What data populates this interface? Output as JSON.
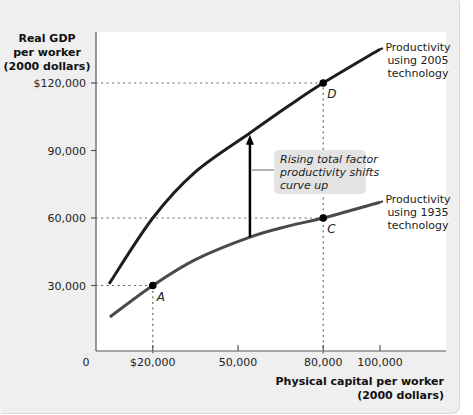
{
  "chart_data": {
    "type": "line",
    "title": "",
    "ylabel_lines": [
      "Real GDP",
      "per worker",
      "(2000 dollars)"
    ],
    "xlabel_lines": [
      "Physical capital per worker",
      "(2000 dollars)"
    ],
    "xlim": [
      0,
      122000
    ],
    "ylim": [
      0,
      142000
    ],
    "grid": false,
    "origin_label": "0",
    "x_ticks": [
      {
        "value": 20000,
        "label": "$20,000"
      },
      {
        "value": 50000,
        "label": "50,000"
      },
      {
        "value": 80000,
        "label": "80,000"
      },
      {
        "value": 100000,
        "label": "100,000"
      }
    ],
    "y_ticks": [
      {
        "value": 30000,
        "label": "30,000"
      },
      {
        "value": 60000,
        "label": "60,000"
      },
      {
        "value": 90000,
        "label": "90,000"
      },
      {
        "value": 120000,
        "label": "$120,000"
      }
    ],
    "series": [
      {
        "name": "Productivity using 2005 technology",
        "label_lines": [
          "Productivity",
          "using 2005",
          "technology"
        ],
        "color": "#1e1e1e",
        "x": [
          4600,
          20000,
          35000,
          54200,
          68000,
          80000,
          100000
        ],
        "y": [
          30700,
          60000,
          80500,
          97800,
          110000,
          120000,
          135000
        ]
      },
      {
        "name": "Productivity using 1935 technology",
        "label_lines": [
          "Productivity",
          "using 1935",
          "technology"
        ],
        "color": "#4a4a4a",
        "x": [
          4900,
          20000,
          35000,
          54200,
          68000,
          80000,
          100000
        ],
        "y": [
          16000,
          30000,
          41500,
          51500,
          56500,
          60000,
          67000
        ]
      }
    ],
    "points": [
      {
        "label": "A",
        "x": 20000,
        "y": 30000,
        "series": "1935"
      },
      {
        "label": "C",
        "x": 80000,
        "y": 60000,
        "series": "1935"
      },
      {
        "label": "D",
        "x": 80000,
        "y": 120000,
        "series": "2005"
      }
    ],
    "reference_lines": [
      {
        "from": [
          0,
          30000
        ],
        "to": [
          20000,
          30000
        ]
      },
      {
        "from": [
          20000,
          0
        ],
        "to": [
          20000,
          30000
        ]
      },
      {
        "from": [
          0,
          60000
        ],
        "to": [
          80000,
          60000
        ]
      },
      {
        "from": [
          0,
          120000
        ],
        "to": [
          80000,
          120000
        ]
      },
      {
        "from": [
          80000,
          0
        ],
        "to": [
          80000,
          120000
        ]
      }
    ],
    "annotations": [
      {
        "text": "Rising total factor productivity shifts curve up",
        "lines": [
          "Rising total factor",
          "productivity shifts",
          "curve up"
        ],
        "arrow": {
          "x": 54200,
          "from_y": 51500,
          "to_y": 97000
        }
      }
    ],
    "colors": {
      "panel_background": "#efefef",
      "plot_background": "#ffffff",
      "annotation_box": "#e3e3e3",
      "axis": "#555555"
    }
  }
}
